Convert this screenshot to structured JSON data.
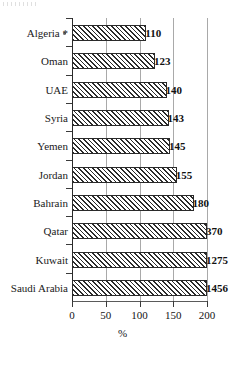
{
  "chart_data": {
    "type": "bar",
    "orientation": "horizontal",
    "title": "",
    "xlabel": "%",
    "ylabel": "",
    "xlim": [
      0,
      200
    ],
    "xticks": [
      0,
      50,
      100,
      150,
      200
    ],
    "grid": true,
    "legend": false,
    "note": "Bars are clipped at the 200% axis maximum; values above 200 extend to the plot edge.",
    "categories": [
      "Algeria *",
      "Oman",
      "UAE",
      "Syria",
      "Yemen",
      "Jordan",
      "Bahrain",
      "Qatar",
      "Kuwait",
      "Saudi Arabia"
    ],
    "values": [
      110,
      123,
      140,
      143,
      145,
      155,
      180,
      370,
      1275,
      1456
    ],
    "value_labels": [
      "110",
      "123",
      "140",
      "143",
      "145",
      "155",
      "180",
      "370",
      "1275",
      "1456"
    ],
    "footnote_marker": "*"
  },
  "axis": {
    "x_tick_labels": [
      "0",
      "50",
      "100",
      "150",
      "200"
    ],
    "x_title": "%"
  }
}
